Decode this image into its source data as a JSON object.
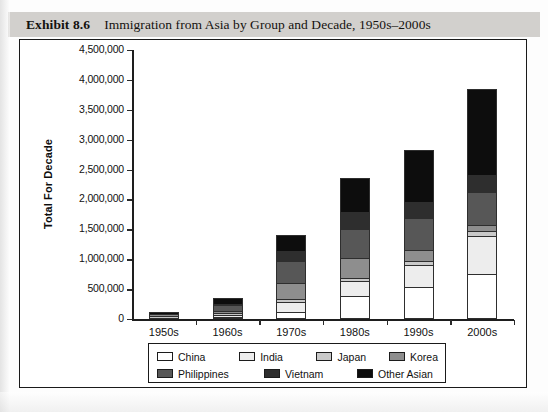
{
  "header": {
    "exhibit_label": "Exhibit 8.6",
    "title": "Immigration from Asia by Group and Decade, 1950s–2000s"
  },
  "axes": {
    "y_title": "Total For Decade",
    "y_ticks": [
      "4,500,000",
      "4,000,000",
      "3,500,000",
      "3,000,000",
      "2,500,000",
      "2,000,000",
      "1,500,000",
      "1,000,000",
      "500,000",
      "0"
    ],
    "x_categories": [
      "1950s",
      "1960s",
      "1970s",
      "1980s",
      "1990s",
      "2000s"
    ]
  },
  "legend": {
    "rows": [
      [
        {
          "label": "China",
          "color": "#ffffff"
        },
        {
          "label": "India",
          "color": "#ededed"
        },
        {
          "label": "Japan",
          "color": "#c9c9c9"
        },
        {
          "label": "Korea",
          "color": "#8e8e8e"
        }
      ],
      [
        {
          "label": "Philippines",
          "color": "#575757"
        },
        {
          "label": "Vietnam",
          "color": "#2e2e2e"
        },
        {
          "label": "Other Asian",
          "color": "#0d0d0d"
        }
      ]
    ]
  },
  "chart_data": {
    "type": "bar",
    "stacked": true,
    "title": "Immigration from Asia by Group and Decade, 1950s–2000s",
    "xlabel": "",
    "ylabel": "Total For Decade",
    "ylim": [
      0,
      4500000
    ],
    "ytick_step": 500000,
    "grid": false,
    "legend_position": "bottom",
    "categories": [
      "1950s",
      "1960s",
      "1970s",
      "1980s",
      "1990s",
      "2000s"
    ],
    "series": [
      {
        "name": "China",
        "color": "#ffffff",
        "values": [
          10000,
          35000,
          125000,
          380000,
          540000,
          750000
        ]
      },
      {
        "name": "India",
        "color": "#ededed",
        "values": [
          2000,
          27000,
          165000,
          255000,
          360000,
          640000
        ]
      },
      {
        "name": "Japan",
        "color": "#c9c9c9",
        "values": [
          46000,
          40000,
          50000,
          48000,
          70000,
          90000
        ]
      },
      {
        "name": "Korea",
        "color": "#8e8e8e",
        "values": [
          6000,
          35000,
          270000,
          335000,
          180000,
          90000
        ]
      },
      {
        "name": "Philippines",
        "color": "#575757",
        "values": [
          20000,
          101000,
          360000,
          495000,
          535000,
          555000
        ]
      },
      {
        "name": "Vietnam",
        "color": "#2e2e2e",
        "values": [
          1000,
          5000,
          172000,
          280000,
          275000,
          290000
        ]
      },
      {
        "name": "Other Asian",
        "color": "#0d0d0d",
        "values": [
          38000,
          107000,
          258000,
          567000,
          860000,
          1425000
        ]
      }
    ],
    "totals": [
      123000,
      350000,
      1400000,
      2360000,
      2820000,
      3840000
    ]
  },
  "source_note": ""
}
